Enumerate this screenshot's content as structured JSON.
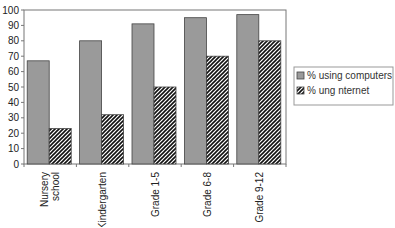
{
  "chart_data": {
    "type": "bar",
    "title": "",
    "xlabel": "",
    "ylabel": "",
    "ylim": [
      0,
      100
    ],
    "yticks": [
      0,
      10,
      20,
      30,
      40,
      50,
      60,
      70,
      80,
      90,
      100
    ],
    "grid": false,
    "legend_position": "right",
    "categories": [
      "Nursery school",
      "Kindergarten",
      "Grade 1-5",
      "Grade 6-8",
      "Grade 9-12"
    ],
    "category_lines": [
      [
        "Nursery",
        "school"
      ],
      [
        "Kindergarten"
      ],
      [
        "Grade 1-5"
      ],
      [
        "Grade 6-8"
      ],
      [
        "Grade 9-12"
      ]
    ],
    "series": [
      {
        "name": "% using computers",
        "values": [
          67,
          80,
          91,
          95,
          97
        ],
        "color": "#9a9a9a",
        "pattern": "solid"
      },
      {
        "name": "% using Internet",
        "legend_text_rendered": "%    ung  nternet",
        "values": [
          23,
          32,
          50,
          70,
          80
        ],
        "color": "#2a2a2a",
        "pattern": "diagonal-hatch"
      }
    ]
  }
}
